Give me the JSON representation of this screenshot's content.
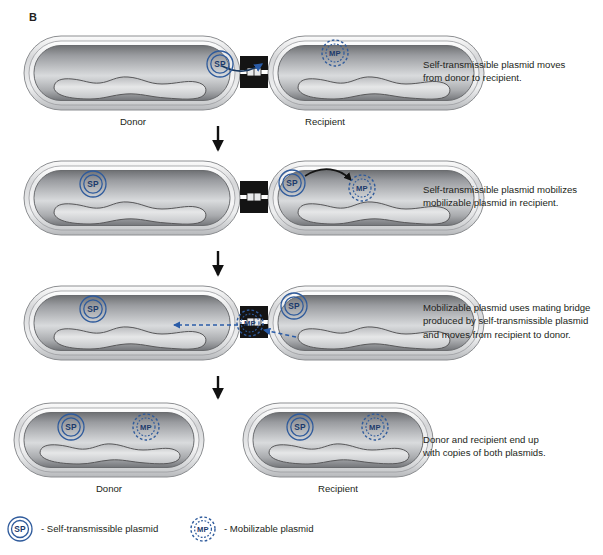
{
  "figure": {
    "panel_letter": "B",
    "background": "#ffffff",
    "plasmid_color": "#2f5b9c",
    "arrow_color": "#2a5ca8",
    "text_color": "#231f20"
  },
  "steps": [
    {
      "id": "step-1",
      "caption_lines": [
        "Self-transmissible plasmid moves",
        "from donor to recipient."
      ],
      "left_cell_label": "Donor",
      "right_cell_label": "Recipient",
      "left_plasmids": [
        "SP"
      ],
      "right_plasmids": [
        "MP"
      ],
      "conjugating": true
    },
    {
      "id": "step-2",
      "caption_lines": [
        "Self-transmissible plasmid mobilizes",
        "mobilizable plasmid in recipient."
      ],
      "left_cell_label": "",
      "right_cell_label": "",
      "left_plasmids": [
        "SP"
      ],
      "right_plasmids": [
        "SP",
        "MP"
      ],
      "conjugating": true
    },
    {
      "id": "step-3",
      "caption_lines": [
        "Mobilizable plasmid uses mating bridge",
        "produced by self-transmissible plasmid",
        "and moves from recipient to donor."
      ],
      "left_cell_label": "",
      "right_cell_label": "",
      "left_plasmids": [
        "SP"
      ],
      "right_plasmids": [
        "MP",
        "SP"
      ],
      "conjugating": true
    },
    {
      "id": "step-4",
      "caption_lines": [
        "Donor and recipient end up",
        "with copies of both plasmids."
      ],
      "left_cell_label": "Donor",
      "right_cell_label": "Recipient",
      "left_plasmids": [
        "SP",
        "MP"
      ],
      "right_plasmids": [
        "SP",
        "MP"
      ],
      "conjugating": false
    }
  ],
  "legend": [
    {
      "icon": "SP",
      "text": "- Self-transmissible plasmid"
    },
    {
      "icon": "MP",
      "text": "- Mobilizable plasmid"
    }
  ],
  "labels": {
    "sp_abbrev": "SP",
    "mp_abbrev": "MP"
  }
}
